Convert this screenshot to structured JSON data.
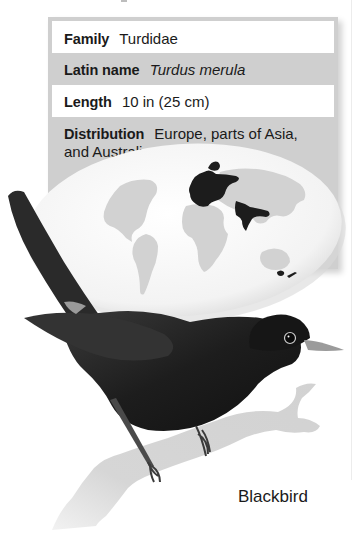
{
  "species_card": {
    "rows": [
      {
        "label": "Family",
        "value": "Turdidae",
        "italic": false
      },
      {
        "label": "Latin name",
        "value": "Turdus merula",
        "italic": true
      },
      {
        "label": "Length",
        "value": "10 in (25 cm)",
        "italic": false
      },
      {
        "label": "Distribution",
        "value": "Europe, parts of Asia, and Australia",
        "italic": false
      }
    ],
    "map": {
      "icon": "world-map-icon",
      "highlighted_regions": [
        "Europe",
        "parts of Asia",
        "Australia"
      ],
      "land_color": "#d2d2d2",
      "ocean_color": "#f4f4f4",
      "range_color": "#1c1c1c"
    },
    "illustration": {
      "icon": "blackbird-illustration",
      "subject": "Blackbird perched on branch"
    },
    "caption": "Blackbird",
    "colors": {
      "panel_gray": "#cfcfcf",
      "row_white": "#ffffff",
      "text": "#1a1a1a"
    }
  }
}
